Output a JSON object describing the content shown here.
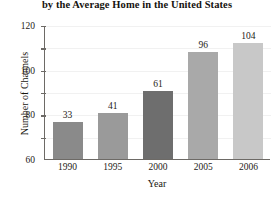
{
  "chart_data": {
    "type": "bar",
    "title": "by the Average Home in the United States",
    "xlabel": "Year",
    "ylabel": "Number of Channels",
    "categories": [
      "1990",
      "1995",
      "2000",
      "2005",
      "2006"
    ],
    "values": [
      33,
      41,
      61,
      96,
      104
    ],
    "value_labels": [
      "33",
      "41",
      "61",
      "96",
      "104"
    ],
    "bar_colors": [
      "#8a8a8a",
      "#9a9a9a",
      "#6e6e6e",
      "#a9a9a9",
      "#c8c8c8"
    ],
    "ylim": [
      0,
      120
    ],
    "yticks": [
      20,
      40,
      60,
      80,
      100,
      120
    ],
    "ytick_labels": [
      "20",
      "40",
      "60",
      "80",
      "100",
      "120"
    ],
    "grid": true,
    "grid_color": "#f1f1f1",
    "legend": null,
    "axis_color": "#6d6a66",
    "text_color": "#1d1a15"
  }
}
